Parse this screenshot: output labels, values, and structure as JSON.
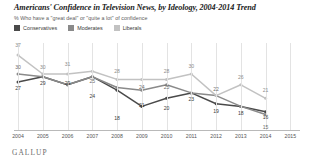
{
  "header": {
    "title": "Americans' Confidence in Television News, by Ideology, 2004-2014 Trend",
    "subtitle": "% Who have a \"great deal\" or \"quite a lot\" of confidence"
  },
  "branding": {
    "logo_text": "GALLUP"
  },
  "legend": {
    "items": [
      {
        "label": "Conservatives",
        "color": "#4a4a4a",
        "key": "conservatives"
      },
      {
        "label": "Moderates",
        "color": "#8a8a8a",
        "key": "moderates"
      },
      {
        "label": "Liberals",
        "color": "#c2c2c2",
        "key": "liberals"
      }
    ]
  },
  "chart_data": {
    "type": "line",
    "title": "Americans' Confidence in Television News, by Ideology, 2004-2014 Trend",
    "subtitle": "% Who have a \"great deal\" or \"quite a lot\" of confidence",
    "xlabel": "",
    "ylabel": "",
    "ylim": [
      10,
      40
    ],
    "grid": "vertical",
    "legend_position": "top-left",
    "data_labels": true,
    "x": [
      2004,
      2005,
      2006,
      2007,
      2008,
      2009,
      2010,
      2011,
      2012,
      2013,
      2014,
      2015
    ],
    "categories": [
      "2004",
      "2005",
      "2006",
      "2007",
      "2008",
      "2009",
      "2010",
      "2011",
      "2012",
      "2013",
      "2014",
      "2015"
    ],
    "series": [
      {
        "name": "Conservatives",
        "color": "#4a4a4a",
        "values": [
          27,
          29,
          26,
          29,
          24,
          18,
          21,
          23,
          19,
          18,
          16,
          null
        ]
      },
      {
        "name": "Moderates",
        "color": "#8a8a8a",
        "values": [
          30,
          29,
          26,
          29,
          25,
          24,
          26,
          23,
          22,
          18,
          15,
          null
        ]
      },
      {
        "name": "Liberals",
        "color": "#c2c2c2",
        "values": [
          37,
          30,
          30,
          31,
          28,
          28,
          28,
          30,
          22,
          26,
          21,
          null
        ]
      }
    ],
    "point_labels": [
      {
        "series": "Liberals",
        "x": 2004,
        "value": 37,
        "dx": 0,
        "dy": -9
      },
      {
        "series": "Moderates",
        "x": 2004,
        "value": 30,
        "dx": 0,
        "dy": -6
      },
      {
        "series": "Conservatives",
        "x": 2004,
        "value": 27,
        "dx": 0,
        "dy": 7
      },
      {
        "series": "Liberals",
        "x": 2005,
        "value": 30,
        "dx": 0,
        "dy": -6
      },
      {
        "series": "Conservatives",
        "x": 2005,
        "value": 29,
        "dx": 0,
        "dy": 7
      },
      {
        "series": "Liberals",
        "x": 2006,
        "value": 31,
        "dx": 0,
        "dy": -6
      },
      {
        "series": "Conservatives",
        "x": 2006,
        "value": 29,
        "dx": 0,
        "dy": 7
      },
      {
        "series": "Moderates",
        "x": 2007,
        "value": 25,
        "dx": 0,
        "dy": -6
      },
      {
        "series": "Conservatives",
        "x": 2007,
        "value": 24,
        "dx": 0,
        "dy": 7
      },
      {
        "series": "Conservatives",
        "x": 2008,
        "value": 18,
        "dx": 0,
        "dy": 13
      },
      {
        "series": "Liberals",
        "x": 2008,
        "value": 28,
        "dx": 0,
        "dy": -7
      },
      {
        "series": "Moderates",
        "x": 2009,
        "value": 24,
        "dx": 0,
        "dy": -2
      },
      {
        "series": "Conservatives",
        "x": 2009,
        "value": 21,
        "dx": 0,
        "dy": 8
      },
      {
        "series": "Liberals",
        "x": 2010,
        "value": 28,
        "dx": 0,
        "dy": -7
      },
      {
        "series": "Moderates",
        "x": 2010,
        "value": 25,
        "dx": 0,
        "dy": 0
      },
      {
        "series": "Conservatives",
        "x": 2010,
        "value": 20,
        "dx": 0,
        "dy": 8
      },
      {
        "series": "Liberals",
        "x": 2011,
        "value": 30,
        "dx": 0,
        "dy": -7
      },
      {
        "series": "Conservatives",
        "x": 2011,
        "value": 23,
        "dx": 0,
        "dy": 7
      },
      {
        "series": "Moderates",
        "x": 2012,
        "value": 22,
        "dx": 0,
        "dy": -6
      },
      {
        "series": "Conservatives",
        "x": 2012,
        "value": 19,
        "dx": 0,
        "dy": 8
      },
      {
        "series": "Liberals",
        "x": 2013,
        "value": 26,
        "dx": 0,
        "dy": -7
      },
      {
        "series": "Conservatives",
        "x": 2013,
        "value": 18,
        "dx": 0,
        "dy": 8
      },
      {
        "series": "Liberals",
        "x": 2014,
        "value": 21,
        "dx": 0,
        "dy": -7
      },
      {
        "series": "Conservatives",
        "x": 2014,
        "value": 16,
        "dx": 0,
        "dy": 6
      },
      {
        "series": "Moderates",
        "x": 2014,
        "value": 15,
        "dx": 0,
        "dy": 13
      }
    ]
  }
}
